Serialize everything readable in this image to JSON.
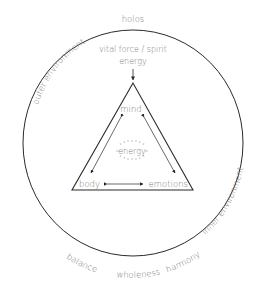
{
  "diagram": {
    "outer_label_top": "holos",
    "outer_label_left_arc": "outer environment",
    "outer_label_right_arc": "inner environment",
    "bottom_arc_labels": [
      "balance",
      "wholeness",
      "harmony"
    ],
    "source_label_line1": "vital force / spirit",
    "source_label_line2": "energy",
    "triangle": {
      "top": "mind",
      "bottom_left": "body",
      "bottom_right": "emotions",
      "center": "energy"
    }
  },
  "colors": {
    "text": "#7a7a7a",
    "line": "#2a2a2a",
    "background": "#ffffff"
  }
}
